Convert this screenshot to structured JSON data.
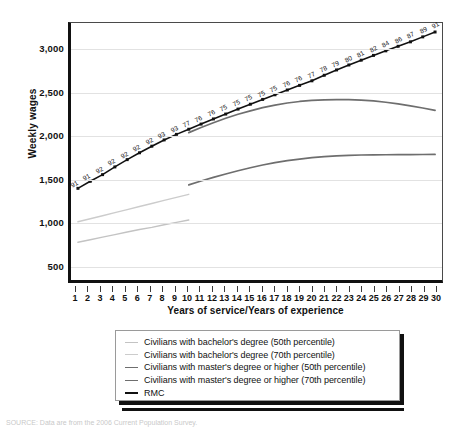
{
  "chart_data": {
    "type": "line",
    "title": "",
    "xlabel": "Years of service/Years of experience",
    "ylabel": "Weekly wages",
    "xlim": [
      1,
      30
    ],
    "ylim": [
      300,
      3300
    ],
    "grid": true,
    "legend_position": "below-plot",
    "x": [
      1,
      2,
      3,
      4,
      5,
      6,
      7,
      8,
      9,
      10,
      11,
      12,
      13,
      14,
      15,
      16,
      17,
      18,
      19,
      20,
      21,
      22,
      23,
      24,
      25,
      26,
      27,
      28,
      29,
      30
    ],
    "ytick_labels": [
      "3,000",
      "2,500",
      "2,000",
      "1,500",
      "1,000",
      "500"
    ],
    "ytick_values": [
      3000,
      2500,
      2000,
      1500,
      1000,
      500
    ],
    "xtick_labels": [
      "1",
      "2",
      "3",
      "4",
      "5",
      "6",
      "7",
      "8",
      "9",
      "10",
      "11",
      "12",
      "13",
      "14",
      "15",
      "16",
      "17",
      "18",
      "19",
      "20",
      "21",
      "22",
      "23",
      "24",
      "25",
      "26",
      "27",
      "28",
      "29",
      "30"
    ],
    "series": [
      {
        "name": "Civilians with bachelor's degree (50th percentile)",
        "color": "#c3c3c3",
        "width": 1.4,
        "x": [
          1,
          2,
          3,
          4,
          5,
          6,
          7,
          8,
          9,
          10
        ],
        "values": [
          740,
          770,
          800,
          830,
          860,
          890,
          915,
          945,
          972,
          1000
        ]
      },
      {
        "name": "Civilians with bachelor's degree (70th percentile)",
        "color": "#cccccc",
        "width": 1.4,
        "x": [
          1,
          2,
          3,
          4,
          5,
          6,
          7,
          8,
          9,
          10
        ],
        "values": [
          980,
          1015,
          1050,
          1087,
          1122,
          1158,
          1193,
          1229,
          1265,
          1300
        ]
      },
      {
        "name": "Civilians with master's degree or higher (50th percentile)",
        "color": "#6e6e6e",
        "width": 1.7,
        "x": [
          10,
          11,
          12,
          13,
          14,
          15,
          16,
          17,
          18,
          19,
          20,
          21,
          22,
          23,
          24,
          25,
          26,
          27,
          28,
          29,
          30
        ],
        "values": [
          1410,
          1455,
          1498,
          1538,
          1575,
          1610,
          1642,
          1670,
          1693,
          1712,
          1728,
          1740,
          1749,
          1755,
          1759,
          1761,
          1762,
          1763,
          1764,
          1765,
          1766
        ]
      },
      {
        "name": "Civilians with master's degree or higher (70th percentile)",
        "color": "#6e6e6e",
        "width": 1.7,
        "x": [
          10,
          11,
          12,
          13,
          14,
          15,
          16,
          17,
          18,
          19,
          20,
          21,
          22,
          23,
          24,
          25,
          26,
          27,
          28,
          29,
          30
        ],
        "values": [
          2020,
          2080,
          2135,
          2188,
          2235,
          2275,
          2312,
          2342,
          2366,
          2384,
          2396,
          2403,
          2406,
          2405,
          2400,
          2390,
          2375,
          2356,
          2333,
          2308,
          2280
        ]
      },
      {
        "name": "RMC",
        "color": "#111111",
        "width": 1.6,
        "marker": "square",
        "x": [
          1,
          2,
          3,
          4,
          5,
          6,
          7,
          8,
          9,
          10,
          11,
          12,
          13,
          14,
          15,
          16,
          17,
          18,
          19,
          20,
          21,
          22,
          23,
          24,
          25,
          26,
          27,
          28,
          29,
          30
        ],
        "values": [
          1370,
          1452,
          1530,
          1620,
          1705,
          1785,
          1862,
          1935,
          2000,
          2060,
          2120,
          2180,
          2237,
          2295,
          2352,
          2408,
          2462,
          2518,
          2572,
          2625,
          2690,
          2752,
          2810,
          2866,
          2922,
          2975,
          3028,
          3080,
          3138,
          3195
        ],
        "point_labels": [
          "91",
          "91",
          "92",
          "92",
          "92",
          "92",
          "92",
          "93",
          "93",
          "77",
          "76",
          "76",
          "75",
          "75",
          "75",
          "75",
          "75",
          "76",
          "76",
          "77",
          "78",
          "79",
          "80",
          "81",
          "82",
          "84",
          "86",
          "87",
          "89",
          "91"
        ]
      }
    ]
  },
  "legend": {
    "items": [
      {
        "label": "Civilians with bachelor's degree (50th percentile)",
        "color": "#c3c3c3",
        "width": "1.4px"
      },
      {
        "label": "Civilians with bachelor's degree (70th percentile)",
        "color": "#cccccc",
        "width": "1.4px"
      },
      {
        "label": "Civilians with master's degree or higher (50th percentile)",
        "color": "#6e6e6e",
        "width": "1.7px"
      },
      {
        "label": "Civilians with master's degree or higher (70th percentile)",
        "color": "#6e6e6e",
        "width": "1.7px"
      },
      {
        "label": "RMC",
        "color": "#111111",
        "width": "2.6px"
      }
    ]
  },
  "bottom_caption": {
    "text": "SOURCE: Data are from the 2006 Current Population Survey."
  }
}
